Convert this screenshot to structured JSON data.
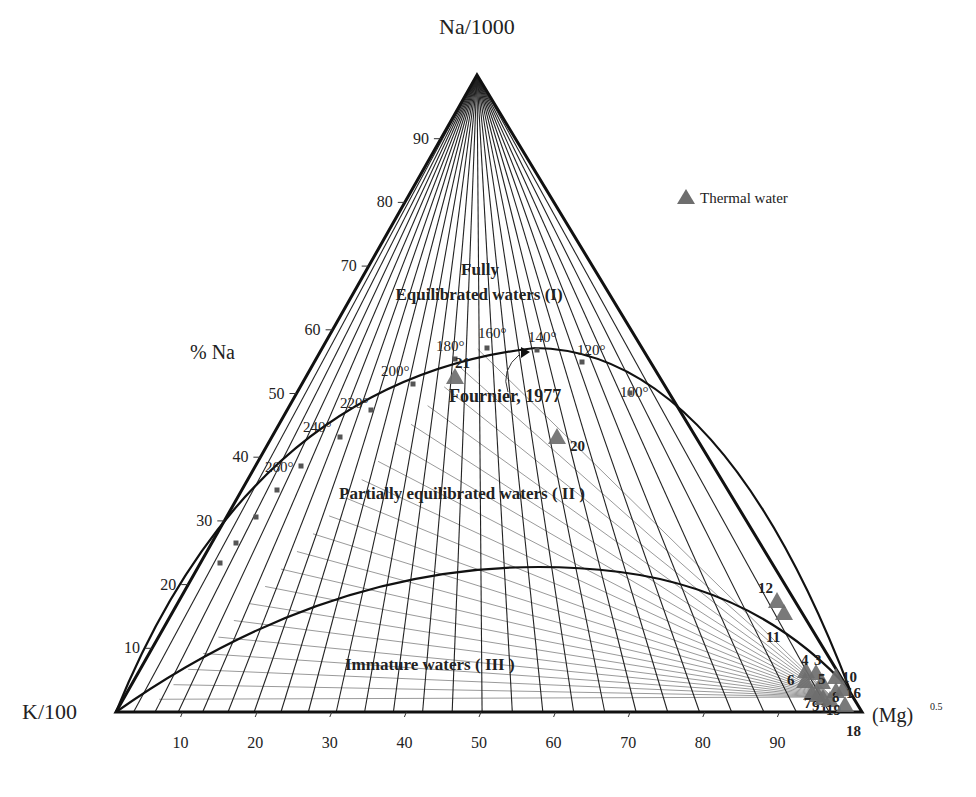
{
  "chart_data": {
    "type": "ternary-scatter",
    "title": "",
    "vertices": {
      "top": "Na/1000",
      "left": "K/100",
      "right": "(Mg)",
      "right_superscript": "0.5"
    },
    "left_axis_label": "% Na",
    "left_axis_ticks": [
      10,
      20,
      30,
      40,
      50,
      60,
      70,
      80,
      90
    ],
    "bottom_axis_ticks": [
      10,
      20,
      30,
      40,
      50,
      60,
      70,
      80,
      90
    ],
    "legend": [
      {
        "label": "Thermal water",
        "marker": "triangle",
        "color": "#6e6e6e"
      }
    ],
    "region_labels": [
      {
        "id": "fully_1",
        "text": "Fully"
      },
      {
        "id": "fully_2",
        "text": "Equilibrated waters (I)"
      },
      {
        "id": "partial",
        "text": "Partially equilibrated waters ( II )"
      },
      {
        "id": "immature",
        "text": "Immature waters ( III )"
      }
    ],
    "annotation": "Fournier, 1977",
    "isotherms_C": [
      100,
      120,
      140,
      160,
      180,
      200,
      220,
      240,
      260
    ],
    "samples": [
      {
        "id": "21",
        "na_pct": 52,
        "mg_pct": 47
      },
      {
        "id": "20",
        "na_pct": 43,
        "mg_pct": 62
      },
      {
        "id": "12",
        "na_pct": 18,
        "mg_pct": 90
      },
      {
        "id": "11",
        "na_pct": 16,
        "mg_pct": 91
      },
      {
        "id": "4",
        "na_pct": 7,
        "mg_pct": 95
      },
      {
        "id": "3",
        "na_pct": 7,
        "mg_pct": 96
      },
      {
        "id": "5",
        "na_pct": 5,
        "mg_pct": 96
      },
      {
        "id": "6",
        "na_pct": 5,
        "mg_pct": 94
      },
      {
        "id": "7",
        "na_pct": 3,
        "mg_pct": 95
      },
      {
        "id": "9",
        "na_pct": 3,
        "mg_pct": 96
      },
      {
        "id": "1",
        "na_pct": 3,
        "mg_pct": 97
      },
      {
        "id": "19",
        "na_pct": 2,
        "mg_pct": 97
      },
      {
        "id": "8",
        "na_pct": 3,
        "mg_pct": 98
      },
      {
        "id": "10",
        "na_pct": 5,
        "mg_pct": 97
      },
      {
        "id": "16",
        "na_pct": 3,
        "mg_pct": 98
      },
      {
        "id": "18",
        "na_pct": 1,
        "mg_pct": 99
      }
    ]
  },
  "colors": {
    "axis": "#111111",
    "grid_dark": "#222222",
    "grid_light": "#9a9a9a",
    "marker": "#6e6e6e"
  }
}
